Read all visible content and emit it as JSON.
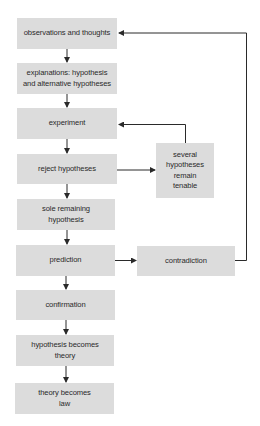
{
  "diagram": {
    "type": "flowchart",
    "colors": {
      "box_fill": "#dcdcdc",
      "line": "#2a2a2a",
      "text": "#2a2a2a",
      "background": "#ffffff"
    },
    "main_steps": [
      {
        "id": "observations",
        "label": "observations and thoughts"
      },
      {
        "id": "explanations",
        "label": "explanations: hypothesis and alternative hypotheses"
      },
      {
        "id": "experiment",
        "label": "experiment"
      },
      {
        "id": "reject",
        "label": "reject hypotheses"
      },
      {
        "id": "sole",
        "label": "sole remaining hypothesis"
      },
      {
        "id": "prediction",
        "label": "prediction"
      },
      {
        "id": "confirmation",
        "label": "confirmation"
      },
      {
        "id": "theory",
        "label": "hypothesis becomes theory"
      },
      {
        "id": "law",
        "label": "theory becomes law"
      }
    ],
    "side_steps": [
      {
        "id": "tenable",
        "label": "several hypotheses remain tenable"
      },
      {
        "id": "contradiction",
        "label": "contradiction"
      }
    ],
    "edges": [
      {
        "from": "observations",
        "to": "explanations"
      },
      {
        "from": "explanations",
        "to": "experiment"
      },
      {
        "from": "experiment",
        "to": "reject"
      },
      {
        "from": "reject",
        "to": "sole"
      },
      {
        "from": "reject",
        "to": "tenable"
      },
      {
        "from": "tenable",
        "to": "experiment"
      },
      {
        "from": "sole",
        "to": "prediction"
      },
      {
        "from": "prediction",
        "to": "confirmation"
      },
      {
        "from": "prediction",
        "to": "contradiction"
      },
      {
        "from": "contradiction",
        "to": "observations"
      },
      {
        "from": "confirmation",
        "to": "theory"
      },
      {
        "from": "theory",
        "to": "law"
      }
    ]
  }
}
